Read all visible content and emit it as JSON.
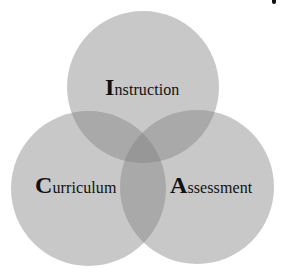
{
  "diagram": {
    "type": "venn-3",
    "colors": {
      "background": "#ffffff",
      "circle_fill": "#c9c9c9",
      "double_overlap": "#a9a9a9",
      "triple_overlap": "#8f8f8f",
      "text": "#111111"
    },
    "sets": [
      {
        "name": "instruction",
        "cap": "I",
        "rest": "nstruction",
        "position": "top"
      },
      {
        "name": "curriculum",
        "cap": "C",
        "rest": "urriculum",
        "position": "bottom-left"
      },
      {
        "name": "assessment",
        "cap": "A",
        "rest": "ssessment",
        "position": "bottom-right"
      }
    ]
  }
}
